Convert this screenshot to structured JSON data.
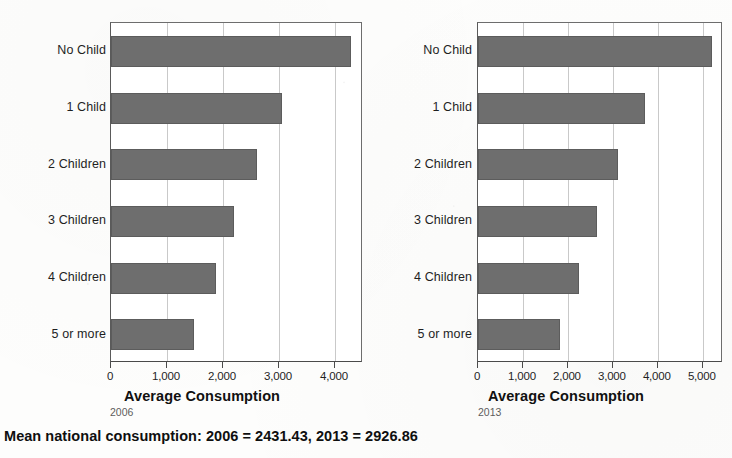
{
  "caption": "Mean national consumption: 2006 = 2431.43, 2013 = 2926.86",
  "panels": [
    {
      "year": "2006",
      "axis_title": "Average Consumption"
    },
    {
      "year": "2013",
      "axis_title": "Average Consumption"
    }
  ],
  "chart_data": [
    {
      "type": "bar",
      "orientation": "horizontal",
      "title": "",
      "subtitle": "2006",
      "xlabel": "Average Consumption",
      "ylabel": "",
      "categories": [
        "No Child",
        "1 Child",
        "2 Children",
        "3 Children",
        "4 Children",
        "5 or more"
      ],
      "values": [
        4290,
        3060,
        2615,
        2190,
        1870,
        1480
      ],
      "xlim": [
        0,
        4500
      ],
      "xticks": [
        0,
        1000,
        2000,
        3000,
        4000
      ],
      "xtick_labels": [
        "0",
        "1,000",
        "2,000",
        "3,000",
        "4,000"
      ],
      "grid": true,
      "legend": "none",
      "bar_color": "#6e6e6e"
    },
    {
      "type": "bar",
      "orientation": "horizontal",
      "title": "",
      "subtitle": "2013",
      "xlabel": "Average Consumption",
      "ylabel": "",
      "categories": [
        "No Child",
        "1 Child",
        "2 Children",
        "3 Children",
        "4 Children",
        "5 or more"
      ],
      "values": [
        5195,
        3715,
        3115,
        2645,
        2255,
        1830
      ],
      "xlim": [
        0,
        5450
      ],
      "xticks": [
        0,
        1000,
        2000,
        3000,
        4000,
        5000
      ],
      "xtick_labels": [
        "0",
        "1,000",
        "2,000",
        "3,000",
        "4,000",
        "5,000"
      ],
      "grid": true,
      "legend": "none",
      "bar_color": "#6e6e6e"
    }
  ]
}
